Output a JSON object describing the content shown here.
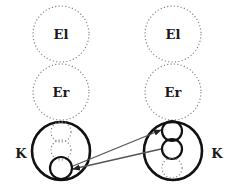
{
  "diagram": {
    "left_stack": {
      "upper_label": "El",
      "middle_label": "Er",
      "bottom_label": "K"
    },
    "right_stack": {
      "upper_label": "El",
      "middle_label": "Er",
      "bottom_label": "K"
    },
    "colors": {
      "solid_stroke": "#111111",
      "dotted_stroke": "#8a8a8a",
      "arrow_stroke": "#555555"
    },
    "arrows": [
      {
        "from": "left-K-small-circle",
        "to": "right-K-top-circle"
      },
      {
        "from": "right-K-middle-circle",
        "to": "left-K-small-circle"
      }
    ]
  }
}
